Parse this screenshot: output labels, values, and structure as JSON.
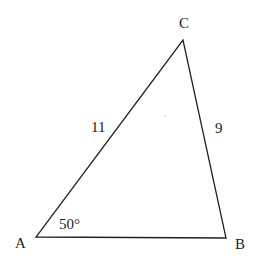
{
  "diagram": {
    "type": "triangle",
    "vertices": {
      "A": {
        "label": "A",
        "x": 36,
        "y": 237
      },
      "B": {
        "label": "B",
        "x": 226,
        "y": 238
      },
      "C": {
        "label": "C",
        "x": 183,
        "y": 40
      }
    },
    "sides": {
      "AC": {
        "label": "11"
      },
      "BC": {
        "label": "9"
      },
      "AB": {
        "label": ""
      }
    },
    "angles": {
      "A": {
        "label": "50°"
      }
    },
    "stroke_color": "#222222",
    "background_color": "#ffffff"
  }
}
